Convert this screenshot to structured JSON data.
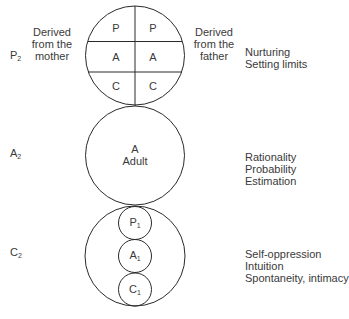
{
  "diagram": {
    "left_labels": {
      "parent_level": {
        "letter": "P",
        "sub": "2"
      },
      "adult_level": {
        "letter": "A",
        "sub": "2"
      },
      "child_level": {
        "letter": "C",
        "sub": "2"
      }
    },
    "top_circle": {
      "left_caption": [
        "Derived",
        "from the",
        "mother"
      ],
      "right_caption": [
        "Derived",
        "from the",
        "father"
      ],
      "cells": {
        "left": [
          "P",
          "A",
          "C"
        ],
        "right": [
          "P",
          "A",
          "C"
        ]
      }
    },
    "middle_circle": {
      "letter": "A",
      "name": "Adult"
    },
    "bottom_circle": {
      "inner": [
        {
          "letter": "P",
          "sub": "1"
        },
        {
          "letter": "A",
          "sub": "1"
        },
        {
          "letter": "C",
          "sub": "1"
        }
      ]
    },
    "right_descriptions": {
      "parent": [
        "Nurturing",
        "Setting limits"
      ],
      "adult": [
        "Rationality",
        "Probability",
        "Estimation"
      ],
      "child": [
        "Self-oppression",
        "Intuition",
        "Spontaneity, intimacy"
      ]
    },
    "colors": {
      "stroke": "#2a2a2a",
      "text": "#3a3a3a",
      "background": "#ffffff"
    }
  }
}
